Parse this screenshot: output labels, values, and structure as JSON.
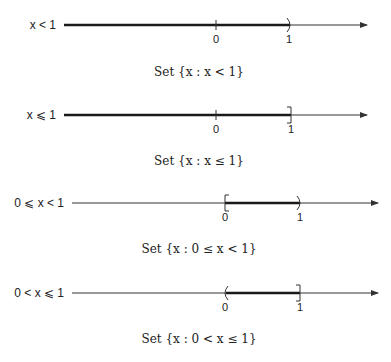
{
  "colors": {
    "line": "#333333",
    "interval": "#1a1a1a",
    "text": "#222222",
    "background": "#ffffff"
  },
  "panels": [
    {
      "inequality": "x < 1",
      "caption": "Set {x : x < 1}",
      "tick_labels": [
        "0",
        "1"
      ],
      "interval": {
        "from": "-infinity",
        "to": 1,
        "left_end": "none",
        "right_end": "open-paren"
      }
    },
    {
      "inequality": "x ⩽ 1",
      "caption": "Set {x : x ≤ 1}",
      "tick_labels": [
        "0",
        "1"
      ],
      "interval": {
        "from": "-infinity",
        "to": 1,
        "left_end": "none",
        "right_end": "closed-bracket"
      }
    },
    {
      "inequality": "0 ⩽ x < 1",
      "caption": "Set {x : 0 ≤ x < 1}",
      "tick_labels": [
        "0",
        "1"
      ],
      "interval": {
        "from": 0,
        "to": 1,
        "left_end": "closed-bracket",
        "right_end": "open-paren"
      }
    },
    {
      "inequality": "0 < x ⩽ 1",
      "caption": "Set {x : 0 < x ≤ 1}",
      "tick_labels": [
        "0",
        "1"
      ],
      "interval": {
        "from": 0,
        "to": 1,
        "left_end": "open-paren",
        "right_end": "closed-bracket"
      }
    }
  ]
}
